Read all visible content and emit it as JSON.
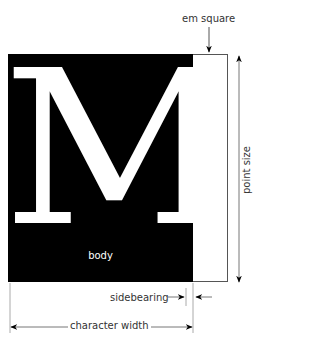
{
  "diagram": {
    "glyph": "M",
    "labels": {
      "em_square": "em square",
      "point_size": "point size",
      "body": "body",
      "sidebearing": "sidebearing",
      "character_width": "character width"
    },
    "colors": {
      "body_fill": "#000000",
      "glyph_fill": "#ffffff",
      "em_square_fill": "#ffffff",
      "line": "#555555"
    }
  }
}
